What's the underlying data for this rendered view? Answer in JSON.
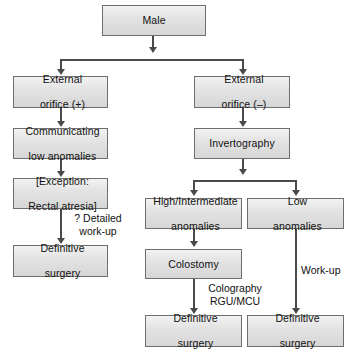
{
  "diagram": {
    "colors": {
      "box_fill_top": "#f2f2f2",
      "box_fill_bottom": "#d6d6d6",
      "box_border": "#6e6e6e",
      "connector": "#4a4a4a",
      "text": "#111111",
      "background": "#ffffff"
    },
    "nodes": [
      {
        "id": "male",
        "line1": "Male",
        "line2": ""
      },
      {
        "id": "external-orifice-positive",
        "line1": "External",
        "line2": "orifice (+)"
      },
      {
        "id": "external-orifice-negative",
        "line1": "External",
        "line2": "orifice (–)"
      },
      {
        "id": "communicating-low-anomalies",
        "line1": "Communicating",
        "line2": "low anomalies"
      },
      {
        "id": "exception-rectal-atresia",
        "line1": "[Exception:",
        "line2": "Rectal atresia]"
      },
      {
        "id": "definitive-surgery-left",
        "line1": "Definitive",
        "line2": "surgery"
      },
      {
        "id": "invertography",
        "line1": "Invertography",
        "line2": ""
      },
      {
        "id": "high-intermediate-anomalies",
        "line1": "High/Intermediate",
        "line2": "anomalies"
      },
      {
        "id": "low-anomalies",
        "line1": "Low",
        "line2": "anomalies"
      },
      {
        "id": "colostomy",
        "line1": "Colostomy",
        "line2": ""
      },
      {
        "id": "definitive-surgery-middle",
        "line1": "Definitive",
        "line2": "surgery"
      },
      {
        "id": "definitive-surgery-right",
        "line1": "Definitive",
        "line2": "surgery"
      }
    ],
    "edge_labels": [
      {
        "id": "detailed-work-up",
        "line1": "? Detailed",
        "line2": "work-up"
      },
      {
        "id": "colography-rgu-mcu",
        "line1": "Colography",
        "line2": "RGU/MCU"
      },
      {
        "id": "work-up",
        "line1": "Work-up",
        "line2": ""
      }
    ]
  }
}
